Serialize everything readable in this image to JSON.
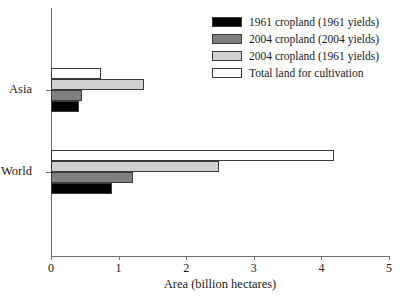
{
  "chart_data": {
    "type": "bar",
    "orientation": "horizontal",
    "title": "",
    "xlabel": "Area (billion hectares)",
    "ylabel": "",
    "xlim": [
      0,
      5
    ],
    "xticks": [
      0,
      1,
      2,
      3,
      4,
      5
    ],
    "xtick_labels": [
      "0",
      "1",
      "2",
      "3",
      "4",
      "5"
    ],
    "grid": false,
    "legend_position": "top-right",
    "categories": [
      "Asia",
      "World"
    ],
    "series": [
      {
        "name": "1961 cropland (1961 yields)",
        "color": "#000000",
        "edge_color": "#3a3a3a",
        "values": [
          0.41,
          0.9
        ]
      },
      {
        "name": "2004 cropland (2004 yields)",
        "color": "#808080",
        "edge_color": "#3a3a3a",
        "values": [
          0.46,
          1.21
        ]
      },
      {
        "name": "2004 cropland (1961 yields)",
        "color": "#d0d0d0",
        "edge_color": "#3a3a3a",
        "values": [
          1.38,
          2.49
        ]
      },
      {
        "name": "Total land for cultivation",
        "color": "#ffffff",
        "edge_color": "#3a3a3a",
        "values": [
          0.74,
          4.19
        ]
      }
    ]
  },
  "legend": {
    "items": [
      {
        "label": "1961 cropland (1961 yields)",
        "color": "#000000"
      },
      {
        "label": "2004 cropland (2004 yields)",
        "color": "#808080"
      },
      {
        "label": "2004 cropland (1961 yields)",
        "color": "#d0d0d0"
      },
      {
        "label": "Total land for cultivation",
        "color": "#ffffff"
      }
    ]
  },
  "axis": {
    "x_title": "Area (billion hectares)",
    "x_tick_labels": [
      "0",
      "1",
      "2",
      "3",
      "4",
      "5"
    ],
    "y_tick_labels": [
      "Asia",
      "World"
    ]
  }
}
